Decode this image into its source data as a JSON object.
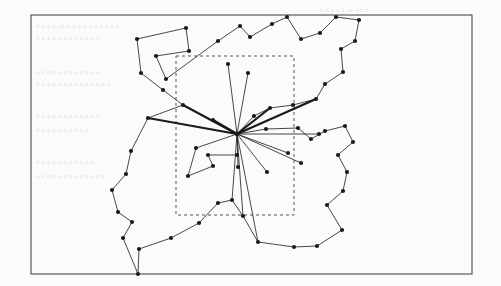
{
  "figure": {
    "background_color": "#fbfbfa",
    "ink_color": "#1a1a1a",
    "frame": {
      "name": "outer-frame",
      "x": 31,
      "y": 15,
      "width": 441,
      "height": 259,
      "stroke": "#4a4a4a",
      "stroke_width": 1.1
    },
    "bounding_box": {
      "name": "dashed-bounding-rectangle",
      "x": 176,
      "y": 56,
      "width": 118,
      "height": 159,
      "stroke": "#555555",
      "stroke_width": 1,
      "dash": "3,3"
    },
    "hub": {
      "name": "central-hub-node",
      "x": 237,
      "y": 134,
      "radius": 2.1
    },
    "node_radius": 2.1,
    "spoke_thin_width": 0.8,
    "spoke_thick_width": 2.2,
    "tour_width": 0.8
  },
  "chart_data": {
    "type": "scatter",
    "xlabel": "",
    "ylabel": "",
    "xlim": [
      31,
      472
    ],
    "ylim": [
      15,
      274
    ],
    "grid": false,
    "legend": "none",
    "annotations": [
      "dashed axis-aligned bounding rectangle of the inner node subset",
      "thick edges mark the heavy spokes of the star",
      "thin closed chain traces the outer polygonal tour"
    ],
    "series": [
      {
        "name": "spokes",
        "note": "edges from central hub to spoke endpoints; weight is stroke emphasis",
        "hub": [
          237,
          134
        ],
        "edges": [
          {
            "to": [
              148,
              118
            ],
            "weight": "thick"
          },
          {
            "to": [
              183,
              105
            ],
            "weight": "thick"
          },
          {
            "to": [
              213,
              120
            ],
            "weight": "thick"
          },
          {
            "to": [
              270,
              108
            ],
            "weight": "thick"
          },
          {
            "to": [
              316,
              99
            ],
            "weight": "thick"
          },
          {
            "to": [
              319,
              134
            ],
            "weight": "thin"
          },
          {
            "to": [
              228,
              64
            ],
            "weight": "thin"
          },
          {
            "to": [
              248,
              73
            ],
            "weight": "thin"
          },
          {
            "to": [
              288,
              153
            ],
            "weight": "thin"
          },
          {
            "to": [
              301,
              163
            ],
            "weight": "thin"
          },
          {
            "to": [
              267,
              172
            ],
            "weight": "thin"
          },
          {
            "to": [
              238,
              167
            ],
            "weight": "thin"
          },
          {
            "to": [
              232,
              200
            ],
            "weight": "thin"
          },
          {
            "to": [
              243,
              216
            ],
            "weight": "thin"
          },
          {
            "to": [
              258,
              242
            ],
            "weight": "thin"
          },
          {
            "to": [
              196,
              148
            ],
            "weight": "thin"
          }
        ]
      },
      {
        "name": "outer-tour",
        "note": "closed polygonal chain of boundary nodes",
        "points": [
          [
            137,
            39
          ],
          [
            186,
            28
          ],
          [
            189,
            51
          ],
          [
            156,
            56
          ],
          [
            166,
            79
          ],
          [
            218,
            41
          ],
          [
            240,
            26
          ],
          [
            250,
            37
          ],
          [
            272,
            24
          ],
          [
            287,
            17
          ],
          [
            301,
            39
          ],
          [
            320,
            33
          ],
          [
            336,
            17
          ],
          [
            359,
            20
          ],
          [
            355,
            41
          ],
          [
            341,
            49
          ],
          [
            343,
            72
          ],
          [
            325,
            84
          ],
          [
            316,
            99
          ],
          [
            293,
            105
          ],
          [
            270,
            108
          ],
          [
            254,
            116
          ],
          [
            237,
            134
          ],
          [
            266,
            129
          ],
          [
            298,
            128
          ],
          [
            311,
            139
          ],
          [
            325,
            131
          ],
          [
            345,
            126
          ],
          [
            353,
            142
          ],
          [
            338,
            155
          ],
          [
            347,
            172
          ],
          [
            343,
            191
          ],
          [
            327,
            205
          ],
          [
            342,
            230
          ],
          [
            317,
            246
          ],
          [
            294,
            247
          ],
          [
            258,
            242
          ],
          [
            243,
            216
          ],
          [
            232,
            200
          ],
          [
            218,
            203
          ],
          [
            199,
            223
          ],
          [
            171,
            238
          ],
          [
            139,
            249
          ],
          [
            138,
            274
          ],
          [
            123,
            238
          ],
          [
            132,
            222
          ],
          [
            118,
            212
          ],
          [
            112,
            190
          ],
          [
            126,
            174
          ],
          [
            131,
            151
          ],
          [
            148,
            118
          ],
          [
            183,
            105
          ],
          [
            163,
            90
          ],
          [
            141,
            73
          ]
        ]
      },
      {
        "name": "inner-chain",
        "note": "short interior chain below the hub",
        "points": [
          [
            196,
            148
          ],
          [
            188,
            176
          ],
          [
            213,
            166
          ],
          [
            208,
            155
          ],
          [
            237,
            155
          ]
        ]
      }
    ]
  },
  "bleed_through_text": [
    {
      "text": "a a s a a ae an a",
      "x": 320,
      "y": 6
    },
    {
      "text": "a a a a aa a a a a a a a a a a",
      "x": 36,
      "y": 22
    },
    {
      "text": "a a a a a a a a a a a a",
      "x": 36,
      "y": 34
    },
    {
      "text": "a a a a a a a a a a a a",
      "x": 36,
      "y": 68
    },
    {
      "text": "a a a a a a a a a a a a a a",
      "x": 36,
      "y": 80
    },
    {
      "text": "a a a a a a a a a a a a",
      "x": 36,
      "y": 112
    },
    {
      "text": "a a a a a a a a a a",
      "x": 36,
      "y": 126
    },
    {
      "text": "a a a a a a a a a a a",
      "x": 36,
      "y": 158
    },
    {
      "text": "a a a a a a a a a a a a a",
      "x": 36,
      "y": 172
    }
  ]
}
